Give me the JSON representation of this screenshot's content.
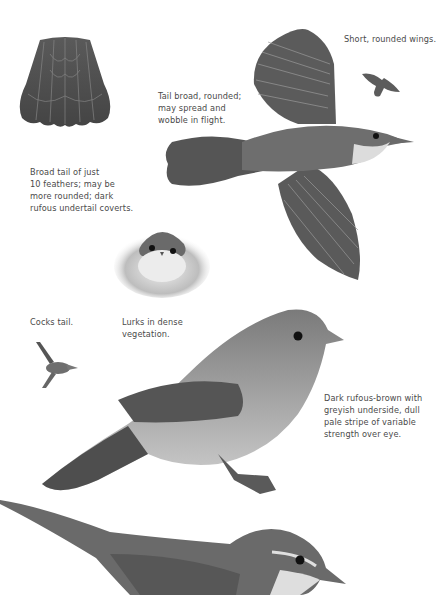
{
  "page": {
    "background": "#ffffff",
    "ink_color": "#4a4a4a",
    "bird_dark": "#4d4d4d",
    "bird_mid": "#7a7a7a",
    "bird_light": "#d8d8d8"
  },
  "captions": {
    "wings": "Short, rounded wings.",
    "tail_flight": "Tail broad, rounded;\nmay spread and\nwobble in flight.",
    "tail_feathers": "Broad tail of just\n10 feathers; may be\nmore rounded; dark\nrufous undertail coverts.",
    "cocks_tail": "Cocks tail.",
    "lurks": "Lurks in dense\nvegetation.",
    "plumage": "Dark rufous-brown with\ngreyish underside, dull\npale stripe of variable\nstrength over eye."
  },
  "illustrations": [
    {
      "id": "tail-fan",
      "label": "spread tail feathers"
    },
    {
      "id": "flying-bird",
      "label": "bird in flight, top view"
    },
    {
      "id": "small-flight-silhouette",
      "label": "small flight silhouette"
    },
    {
      "id": "front-facing-bird",
      "label": "bird peering from vegetation"
    },
    {
      "id": "cocked-tail-bird",
      "label": "small bird with cocked tail"
    },
    {
      "id": "perched-bird",
      "label": "perched bird, side view"
    },
    {
      "id": "lower-bird",
      "label": "bird with long tail, side view"
    }
  ]
}
